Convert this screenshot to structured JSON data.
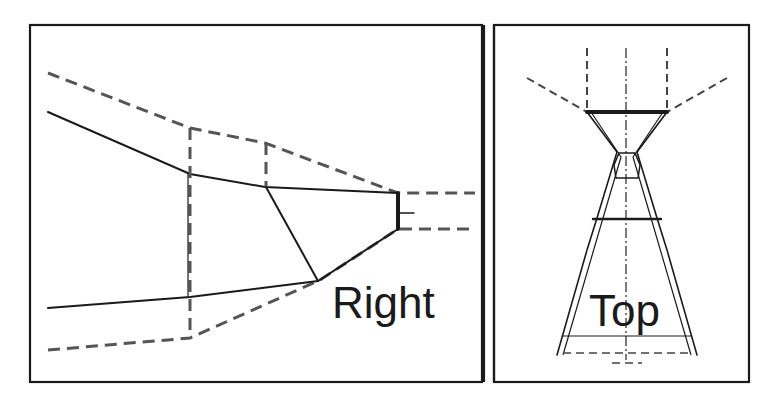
{
  "figure": {
    "panels": [
      {
        "id": "right",
        "label": "Right"
      },
      {
        "id": "top",
        "label": "Top"
      }
    ],
    "line_styles": {
      "solid": "#1a1a1a",
      "dashed": "#555555"
    }
  }
}
